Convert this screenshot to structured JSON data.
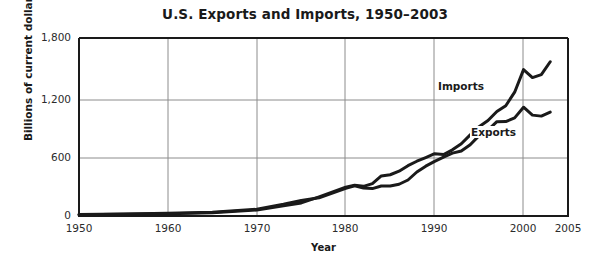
{
  "chart_data": {
    "type": "line",
    "title": "U.S. Exports and Imports, 1950–2003",
    "xlabel": "Year",
    "ylabel": "Billions of current dollars",
    "xlim": [
      1950,
      2005
    ],
    "ylim": [
      0,
      1800
    ],
    "xticks": [
      "1950",
      "1960",
      "1970",
      "1980",
      "1990",
      "2000",
      "2005"
    ],
    "xtick_values": [
      1950,
      1960,
      1970,
      1980,
      1990,
      2000,
      2005
    ],
    "yticks": [
      "0",
      "600",
      "1,200",
      "1,800"
    ],
    "ytick_values": [
      0,
      600,
      1200,
      1800
    ],
    "grid": "both",
    "legend_position": "inline-annotations",
    "line_color": "#1a1a1a",
    "grid_color": "#8c8c8c",
    "axis_color": "#1a1a1a",
    "background": "#ffffff",
    "x": [
      1950,
      1955,
      1960,
      1965,
      1970,
      1973,
      1975,
      1977,
      1980,
      1981,
      1982,
      1983,
      1984,
      1985,
      1986,
      1987,
      1988,
      1989,
      1990,
      1991,
      1992,
      1993,
      1994,
      1995,
      1996,
      1997,
      1998,
      1999,
      2000,
      2001,
      2002,
      2003
    ],
    "series": [
      {
        "name": "Imports",
        "values": [
          12,
          18,
          23,
          32,
          60,
          103,
          132,
          194,
          291,
          310,
          300,
          328,
          405,
          417,
          453,
          509,
          554,
          591,
          630,
          622,
          669,
          730,
          820,
          903,
          965,
          1056,
          1115,
          1252,
          1480,
          1400,
          1430,
          1560
        ]
      },
      {
        "name": "Exports",
        "values": [
          14,
          20,
          27,
          39,
          68,
          118,
          157,
          184,
          280,
          306,
          283,
          277,
          303,
          303,
          321,
          364,
          445,
          504,
          552,
          596,
          636,
          658,
          721,
          813,
          868,
          954,
          955,
          992,
          1100,
          1020,
          1010,
          1050
        ]
      }
    ],
    "annotations": [
      {
        "text": "Imports",
        "x": 1990.5,
        "y": 1050
      },
      {
        "text": "Exports",
        "x": 1994.5,
        "y": 560
      }
    ]
  }
}
